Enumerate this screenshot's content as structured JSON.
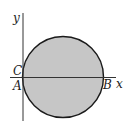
{
  "diagram": {
    "type": "geometry",
    "colors": {
      "background": "#ffffff",
      "circle_fill": "#c6c6c6",
      "circle_stroke": "#1a1a1a",
      "axis": "#333333",
      "label": "#222222"
    },
    "axes": {
      "x_label": "x",
      "y_label": "y"
    },
    "points": {
      "A": "A",
      "B": "B",
      "C": "C"
    },
    "circle": {
      "cx": 63,
      "cy": 77,
      "r": 41
    }
  }
}
